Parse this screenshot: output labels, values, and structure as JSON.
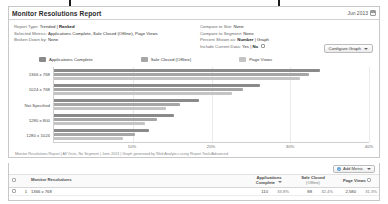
{
  "report": {
    "title": "Monitor Resolutions Report",
    "date_label": "Jun 2013",
    "calendar_icon": "calendar-icon",
    "params_left": [
      {
        "label": "Report Type:",
        "value": "Trended | ",
        "strong": "Ranked"
      },
      {
        "label": "Selected Metrics:",
        "value": "Applications Complete, Sale Closed (Offline), Page Views"
      },
      {
        "label": "Broken Down by:",
        "value": "None"
      }
    ],
    "params_right": [
      {
        "label": "Compare to Site:",
        "value": "None"
      },
      {
        "label": "Compare to Segment:",
        "value": "None"
      },
      {
        "label": "Percent Shown as:",
        "strong": "Number",
        "value": " | Graph"
      },
      {
        "label": "Include Current Data:",
        "value": "Yes | ",
        "strong": "No",
        "checkbox": true
      }
    ],
    "configure_graph_label": "Configure Graph",
    "footnote": "Monitor Resolutions Report | All Visits, No Segment | June 2013 | Graph generated by Web Analytics using Report Tools/Advanced"
  },
  "chart_data": {
    "type": "bar",
    "orientation": "horizontal",
    "title": "Monitor Resolutions Report",
    "xlabel": "",
    "ylabel": "",
    "xlim": [
      0,
      40
    ],
    "xticks": [
      "0%",
      "10%",
      "20%",
      "30%",
      "40%"
    ],
    "xtick_values": [
      0,
      10,
      20,
      30,
      40
    ],
    "grid": true,
    "legend_position": "top",
    "categories": [
      "1366 x 768",
      "1024 x 768",
      "Not Specified",
      "1280 x 800",
      "1280 x 1024"
    ],
    "series": [
      {
        "name": "Applications Complete",
        "color": "#8a8a8a",
        "values": [
          33.8,
          26.1,
          18.4,
          15.2,
          12.0
        ]
      },
      {
        "name": "Sale Closed (Offline)",
        "color": "#a6a6a6",
        "values": [
          32.4,
          24.0,
          16.0,
          13.1,
          10.3
        ]
      },
      {
        "name": "Page Views",
        "color": "#c4c4c4",
        "values": [
          31.3,
          22.6,
          14.2,
          11.6,
          8.7
        ]
      }
    ]
  },
  "table": {
    "add_metric_label": "Add Metric",
    "add_metric_icon": "plus-icon",
    "columns": [
      {
        "key": "check",
        "label": ""
      },
      {
        "key": "rank",
        "label": ""
      },
      {
        "key": "name",
        "label": "Monitor Resolutions"
      },
      {
        "key": "apps",
        "label": "Applications",
        "sub": "Complete",
        "sorted": true
      },
      {
        "key": "sale",
        "label": "Sale Closed",
        "sub": "(Offline)"
      },
      {
        "key": "views",
        "label": "Page Views",
        "sub": ""
      }
    ],
    "rows": [
      {
        "rank": "1",
        "name": "1366 x 768",
        "apps": "110",
        "apps_pct": "33.8%",
        "sale": "88",
        "sale_pct": "32.4%",
        "views": "2,580",
        "views_pct": "31.3%"
      }
    ]
  }
}
